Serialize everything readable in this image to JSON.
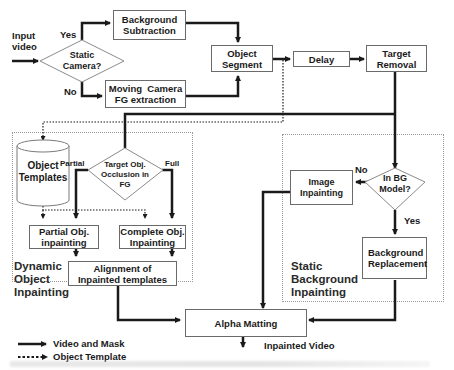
{
  "diagram": {
    "input": "Input\nvideo",
    "decisions": {
      "static_camera": {
        "label": "Static\nCamera?",
        "yes": "Yes",
        "no": "No"
      },
      "occlusion": {
        "label": "Target Obj.\nOcclusion in\nFG",
        "partial": "Partial",
        "full": "Full"
      },
      "in_bg_model": {
        "label": "In BG\nModel?",
        "no": "No",
        "yes": "Yes"
      }
    },
    "nodes": {
      "background_subtraction": "Background\nSubtraction",
      "moving_camera": "Moving  Camera\nFG extraction",
      "object_segment": "Object\nSegment",
      "delay": "Delay",
      "target_removal": "Target\nRemoval",
      "object_templates": "Object\nTemplates",
      "partial_inpainting": "Partial Obj.\ninpainting",
      "complete_inpainting": "Complete Obj.\nInpainting",
      "alignment": "Alignment of\nInpainted templates",
      "image_inpainting": "Image\nInpainting",
      "background_replacement": "Background\nReplacement",
      "alpha_matting": "Alpha Matting"
    },
    "regions": {
      "dynamic": "Dynamic\nObject\nInpainting",
      "static": "Static\nBackground\nInpainting"
    },
    "output": "Inpainted Video",
    "legend": {
      "solid": "Video and Mask",
      "dotted": "Object Template"
    },
    "colors": {
      "line": "#1a1a1a",
      "box_border": "#6a6a6a",
      "region_border": "#9a9a9a"
    }
  }
}
